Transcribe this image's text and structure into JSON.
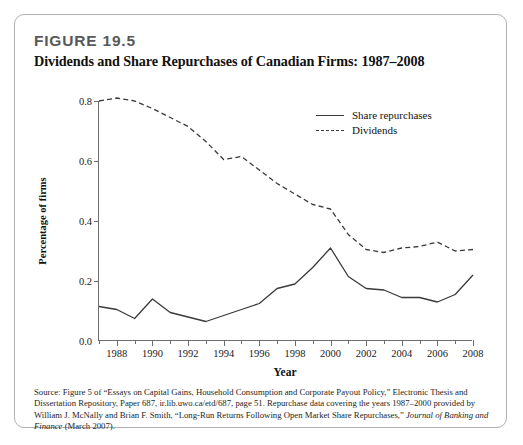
{
  "figure": {
    "number": "FIGURE 19.5",
    "title": "Dividends and Share Repurchases of Canadian Firms: 1987–2008"
  },
  "source_note": "Source: Figure 5 of “Essays on Capital Gains, Household Consumption and Corporate Payout Policy,” Electronic Thesis and Dissertation Repository, Paper 687, ir.lib.uwo.ca/etd/687, page 51. Repurchase data covering the years 1987–2000 provided by William J. McNally and Brian F. Smith, “Long-Run Returns Following Open Market Share Repurchases,” Journal of Banking and Finance (March 2007).",
  "legend": {
    "position": "top-right-inside",
    "items": [
      {
        "label": "Share repurchases",
        "style": "solid"
      },
      {
        "label": "Dividends",
        "style": "dashed"
      }
    ]
  },
  "axes": {
    "y_ticks": [
      "0.0",
      "0.2",
      "0.4",
      "0.6",
      "0.8"
    ],
    "x_ticks": [
      "1988",
      "1990",
      "1992",
      "1994",
      "1996",
      "1998",
      "2000",
      "2002",
      "2004",
      "2006",
      "2008"
    ]
  },
  "colors": {
    "line": "#3a3a3a",
    "axis": "#6d6d6d",
    "card_border": "#b0b0b0",
    "figure_number": "#58585a",
    "background": "#ffffff"
  },
  "chart_data": {
    "type": "line",
    "title": "Dividends and Share Repurchases of Canadian Firms: 1987–2008",
    "xlabel": "Year",
    "ylabel": "Percentage of firms",
    "xlim": [
      1987,
      2008
    ],
    "ylim": [
      0.0,
      0.8
    ],
    "grid": false,
    "legend_position": "upper right",
    "x": [
      1987,
      1988,
      1989,
      1990,
      1991,
      1992,
      1993,
      1994,
      1995,
      1996,
      1997,
      1998,
      1999,
      2000,
      2001,
      2002,
      2003,
      2004,
      2005,
      2006,
      2007,
      2008
    ],
    "series": [
      {
        "name": "Share repurchases",
        "style": "solid",
        "values": [
          0.115,
          0.105,
          0.075,
          0.14,
          0.095,
          0.08,
          0.065,
          0.085,
          0.105,
          0.125,
          0.175,
          0.19,
          0.245,
          0.31,
          0.215,
          0.175,
          0.17,
          0.145,
          0.145,
          0.13,
          0.155,
          0.22
        ]
      },
      {
        "name": "Dividends",
        "style": "dashed",
        "values": [
          0.8,
          0.81,
          0.8,
          0.775,
          0.745,
          0.715,
          0.665,
          0.605,
          0.615,
          0.57,
          0.525,
          0.49,
          0.455,
          0.44,
          0.355,
          0.305,
          0.295,
          0.31,
          0.315,
          0.33,
          0.3,
          0.305
        ]
      }
    ]
  }
}
